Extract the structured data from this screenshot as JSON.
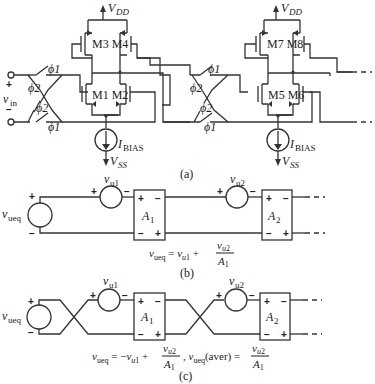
{
  "figure": {
    "part_a": {
      "caption": "(a)",
      "vdd_label": "V",
      "vdd_sub": "DD",
      "vss_label": "V",
      "vss_sub": "SS",
      "ibias_label": "I",
      "ibias_sub": "BIAS",
      "vin_label": "v",
      "vin_sub": "in",
      "vin_plus": "+",
      "vin_minus": "−",
      "phi1": "ϕ1",
      "phi2": "ϕ2",
      "stage1": {
        "upper_pair": "M3 M4",
        "lower_pair": "M1 M2"
      },
      "stage2": {
        "upper_pair": "M7 M8",
        "lower_pair": "M5 M6"
      }
    },
    "part_b": {
      "caption": "(b)",
      "source_label": "v",
      "source_sub": "ueq",
      "vu1_label": "v",
      "vu1_sub": "u1",
      "vu2_label": "v",
      "vu2_sub": "u2",
      "amp1": "A",
      "amp1_sub": "1",
      "amp2": "A",
      "amp2_sub": "2",
      "equation": "vueq = vu1 + vu2/A1"
    },
    "part_c": {
      "caption": "(c)",
      "source_label": "v",
      "source_sub": "ueq",
      "vu1_label": "v",
      "vu1_sub": "u1",
      "vu2_label": "v",
      "vu2_sub": "u2",
      "amp1": "A",
      "amp1_sub": "1",
      "amp2": "A",
      "amp2_sub": "2",
      "equation": "vueq = −vu1 + vu2/A1 , vueq(aver) = vu2/A1"
    },
    "plus": "+",
    "minus": "−"
  }
}
